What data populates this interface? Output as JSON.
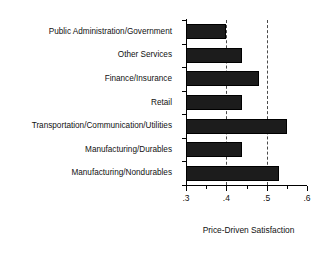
{
  "chart_data": {
    "type": "bar",
    "orientation": "horizontal",
    "title": "",
    "xlabel": "Price-Driven Satisfaction",
    "ylabel": "",
    "categories": [
      "Public Administration/Government",
      "Other Services",
      "Finance/Insurance",
      "Retail",
      "Transportation/Communication/Utilities",
      "Manufacturing/Durables",
      "Manufacturing/Nondurables"
    ],
    "values": [
      0.4,
      0.44,
      0.48,
      0.44,
      0.55,
      0.44,
      0.53
    ],
    "xlim": [
      0.3,
      0.6
    ],
    "x_major_ticks": [
      0.3,
      0.4,
      0.5,
      0.6
    ],
    "x_major_tick_labels": [
      ".3",
      ".4",
      ".5",
      ".6"
    ],
    "x_minor_ticks": [
      0.35,
      0.45,
      0.55
    ],
    "gridlines": [
      0.4,
      0.5
    ],
    "grid": "dashed-vertical",
    "legend": "none",
    "bar_color": "#1c1c1c",
    "axis_color": "#000000",
    "grid_color": "#4a4a4a",
    "background": "#ffffff"
  }
}
